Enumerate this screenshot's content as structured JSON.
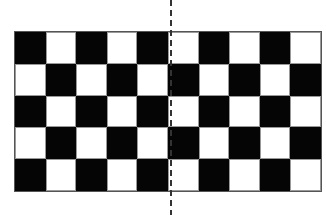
{
  "diagram": {
    "type": "checkerboard",
    "columns": 10,
    "rows": 5,
    "top_left_color": "black",
    "colors": {
      "dark": "#050505",
      "light": "#ffffff",
      "outline": "#555555"
    },
    "symmetry_line": {
      "orientation": "vertical",
      "style": "dashed",
      "position": "center",
      "color": "#333333"
    }
  }
}
